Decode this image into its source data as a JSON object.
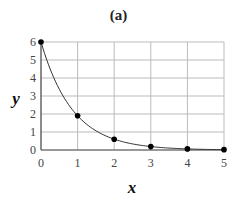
{
  "chart_data": {
    "type": "line",
    "title": "(a)",
    "xlabel": "x",
    "ylabel": "y",
    "x": [
      0,
      1,
      2,
      3,
      4,
      5
    ],
    "series": [
      {
        "name": "y",
        "values": [
          6.0,
          1.9,
          0.6,
          0.19,
          0.06,
          0.02
        ],
        "markers": true
      }
    ],
    "xlim": [
      0,
      5
    ],
    "ylim": [
      0,
      6
    ],
    "xticks": [
      "0",
      "1",
      "2",
      "3",
      "4",
      "5"
    ],
    "yticks": [
      "0",
      "1",
      "2",
      "3",
      "4",
      "5",
      "6"
    ],
    "grid": true,
    "legend": null,
    "line_color": "#333333",
    "marker_color": "#000000",
    "grid_color": "#bbbbbb"
  }
}
